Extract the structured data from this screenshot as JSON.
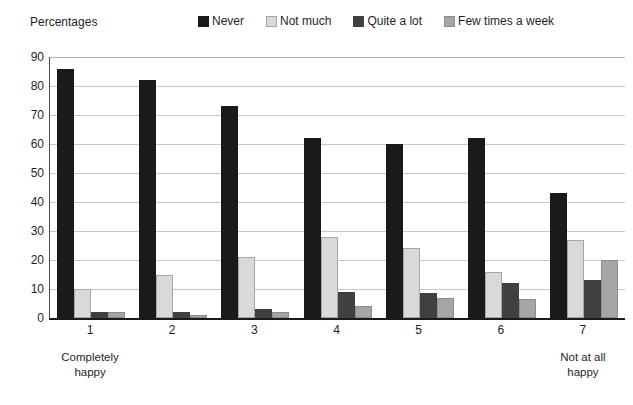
{
  "chart_data": {
    "type": "bar",
    "title": "",
    "ylabel": "Percentages",
    "xlabel": "",
    "ylim": [
      0,
      90
    ],
    "ytick_step": 10,
    "yticks": [
      90,
      80,
      70,
      60,
      50,
      40,
      30,
      20,
      10,
      0
    ],
    "grid": true,
    "legend_position": "top",
    "categories": [
      "1",
      "2",
      "3",
      "4",
      "5",
      "6",
      "7"
    ],
    "category_captions": [
      [
        "Completely",
        "happy"
      ],
      [
        "",
        ""
      ],
      [
        "",
        ""
      ],
      [
        "",
        ""
      ],
      [
        "",
        ""
      ],
      [
        "",
        ""
      ],
      [
        "Not at all",
        "happy"
      ]
    ],
    "series": [
      {
        "name": "Never",
        "color": "#1a1a1a",
        "border": "#1a1a1a",
        "values": [
          86,
          82,
          73,
          62,
          60,
          62,
          43
        ]
      },
      {
        "name": "Not much",
        "color": "#d9d9d9",
        "border": "#a6a6a6",
        "values": [
          10,
          15,
          21,
          28,
          24,
          16,
          27
        ]
      },
      {
        "name": "Quite a lot",
        "color": "#404040",
        "border": "#404040",
        "values": [
          2,
          2,
          3,
          9,
          8.5,
          12,
          13
        ]
      },
      {
        "name": "Few times a week",
        "color": "#a6a6a6",
        "border": "#8c8c8c",
        "values": [
          2,
          1,
          2,
          4,
          7,
          6.5,
          20
        ]
      }
    ]
  }
}
